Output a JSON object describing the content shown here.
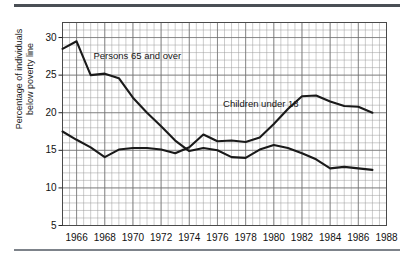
{
  "figure": {
    "name": "poverty-rate-line-chart",
    "ylabel_line1": "Percentage of individuals",
    "ylabel_line2": "below poverty line"
  },
  "chart_data": {
    "type": "line",
    "title": "",
    "subtitle": "",
    "xlabel": "",
    "ylabel": "Percentage of individuals below poverty line",
    "xlim": [
      1965,
      1988
    ],
    "ylim": [
      5,
      32
    ],
    "yticks": [
      5,
      10,
      15,
      20,
      25,
      30
    ],
    "ytick_labels": [
      "5",
      "10",
      "15",
      "20",
      "25",
      "30"
    ],
    "xticks": [
      1966,
      1968,
      1970,
      1972,
      1974,
      1976,
      1978,
      1980,
      1982,
      1984,
      1986,
      1988
    ],
    "xtick_labels": [
      "1966",
      "1968",
      "1970",
      "1972",
      "1974",
      "1976",
      "1978",
      "1980",
      "1982",
      "1984",
      "1986",
      "1988"
    ],
    "grid": true,
    "grid_minor_x_step": 0.5,
    "grid_minor_y_step": 1,
    "legend": "inline-annotations",
    "annotations": [
      {
        "text": "Persons 65 and over",
        "x": 1967.2,
        "y": 27.6
      },
      {
        "text": "Children under 18",
        "x": 1976.4,
        "y": 21.2
      }
    ],
    "series": [
      {
        "name": "Persons 65 and over",
        "color": "#1a1a1a",
        "x": [
          1965,
          1966,
          1967,
          1968,
          1969,
          1970,
          1971,
          1972,
          1973,
          1974,
          1975,
          1976,
          1977,
          1978,
          1979,
          1980,
          1981,
          1982,
          1983,
          1984,
          1985,
          1986,
          1987
        ],
        "values": [
          28.5,
          29.5,
          25.0,
          25.2,
          24.6,
          22.0,
          20.0,
          18.2,
          16.3,
          14.9,
          15.3,
          15.0,
          14.1,
          14.0,
          15.1,
          15.7,
          15.3,
          14.6,
          13.8,
          12.6,
          12.8,
          12.6,
          12.4
        ]
      },
      {
        "name": "Children under 18",
        "color": "#1a1a1a",
        "x": [
          1965,
          1966,
          1967,
          1968,
          1969,
          1970,
          1971,
          1972,
          1973,
          1974,
          1975,
          1976,
          1977,
          1978,
          1979,
          1980,
          1981,
          1982,
          1983,
          1984,
          1985,
          1986,
          1987
        ],
        "values": [
          17.5,
          16.4,
          15.4,
          14.1,
          15.1,
          15.3,
          15.3,
          15.1,
          14.6,
          15.4,
          17.1,
          16.2,
          16.3,
          16.1,
          16.7,
          18.5,
          20.5,
          22.2,
          22.3,
          21.5,
          20.9,
          20.8,
          20.0
        ]
      }
    ]
  }
}
